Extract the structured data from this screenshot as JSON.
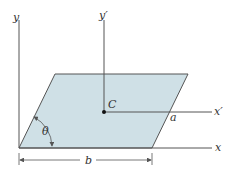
{
  "diagram": {
    "colors": {
      "fill": "#cfe0e6",
      "stroke": "#555555",
      "axis": "#555555",
      "text": "#333333"
    },
    "shape": {
      "type": "parallelogram",
      "points": [
        [
          19,
          148
        ],
        [
          152,
          148
        ],
        [
          188,
          74
        ],
        [
          55,
          74
        ]
      ]
    },
    "centroid": {
      "x": 104,
      "y": 112,
      "label": "C"
    },
    "axes": {
      "y": {
        "label": "y",
        "x": 19,
        "top": 20,
        "bottom": 148
      },
      "x": {
        "label": "x",
        "y": 148,
        "left": 19,
        "right": 212
      },
      "y_prime": {
        "label": "y′",
        "x": 104,
        "top": 20,
        "bottom": 112
      },
      "x_prime": {
        "label": "x′",
        "y": 112,
        "left": 104,
        "right": 212
      }
    },
    "dimensions": {
      "b": {
        "label": "b",
        "y": 160,
        "x1": 19,
        "x2": 152
      },
      "a": {
        "label": "a"
      },
      "theta": {
        "label": "θ"
      }
    }
  }
}
